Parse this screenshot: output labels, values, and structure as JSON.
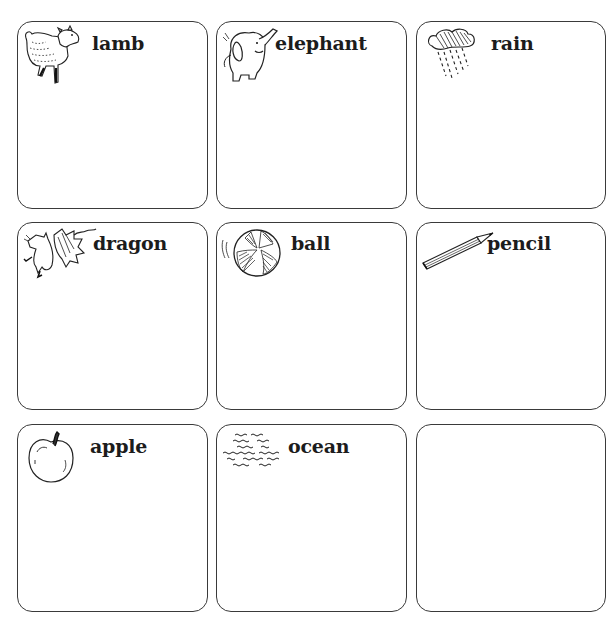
{
  "worksheet": {
    "cards": [
      {
        "word": "lamb",
        "picture": "lamb-icon"
      },
      {
        "word": "elephant",
        "picture": "elephant-icon"
      },
      {
        "word": "rain",
        "picture": "rain-cloud-icon"
      },
      {
        "word": "dragon",
        "picture": "dragon-icon"
      },
      {
        "word": "ball",
        "picture": "beach-ball-icon"
      },
      {
        "word": "pencil",
        "picture": "pencil-icon"
      },
      {
        "word": "apple",
        "picture": "apple-icon"
      },
      {
        "word": "ocean",
        "picture": "ocean-waves-icon"
      },
      {
        "word": "",
        "picture": ""
      }
    ],
    "border_color": "#3a3a3a",
    "text_color": "#1c1c1c"
  }
}
